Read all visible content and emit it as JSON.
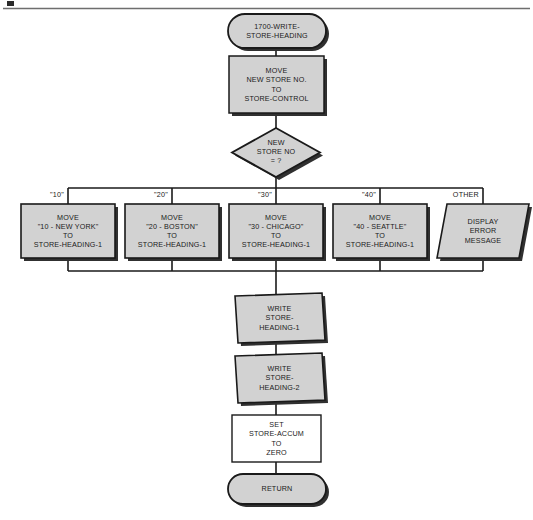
{
  "page": {
    "background_color": "#ffffff",
    "shape_fill": "#d2d2d2",
    "shape_stroke": "#1a1a1a",
    "shadow_color": "#303030",
    "connector_color": "#1a1a1a",
    "rule_color": "#6e6e6e"
  },
  "nodes": {
    "start_terminal": {
      "shape": "terminator",
      "line1": "1700-WRITE-",
      "line2": "STORE-HEADING"
    },
    "move_store_control": {
      "shape": "process",
      "line1": "MOVE",
      "line2": "NEW STORE NO.",
      "line3": "TO",
      "line4": "STORE-CONTROL"
    },
    "decision_new_store_no": {
      "shape": "decision",
      "line1": "NEW",
      "line2": "STORE NO",
      "line3": "= ?"
    },
    "branch_10": {
      "shape": "process",
      "label": "\"10\"",
      "line1": "MOVE",
      "line2": "\"10 - NEW YORK\"",
      "line3": "TO",
      "line4": "STORE-HEADING-1"
    },
    "branch_20": {
      "shape": "process",
      "label": "\"20\"",
      "line1": "MOVE",
      "line2": "\"20 - BOSTON\"",
      "line3": "TO",
      "line4": "STORE-HEADING-1"
    },
    "branch_30": {
      "shape": "process",
      "label": "\"30\"",
      "line1": "MOVE",
      "line2": "\"30 - CHICAGO\"",
      "line3": "TO",
      "line4": "STORE-HEADING-1"
    },
    "branch_40": {
      "shape": "process",
      "label": "\"40\"",
      "line1": "MOVE",
      "line2": "\"40 - SEATTLE\"",
      "line3": "TO",
      "line4": "STORE-HEADING-1"
    },
    "branch_other": {
      "shape": "input-output",
      "label": "OTHER",
      "line1": "DISPLAY",
      "line2": "ERROR",
      "line3": "MESSAGE"
    },
    "write_heading_1": {
      "shape": "input-output",
      "line1": "WRITE",
      "line2": "STORE-",
      "line3": "HEADING-1"
    },
    "write_heading_2": {
      "shape": "input-output",
      "line1": "WRITE",
      "line2": "STORE-",
      "line3": "HEADING-2"
    },
    "set_store_accum": {
      "shape": "process",
      "line1": "SET",
      "line2": "STORE-ACCUM",
      "line3": "TO",
      "line4": "ZERO"
    },
    "return_terminal": {
      "shape": "terminator",
      "line1": "RETURN"
    }
  }
}
